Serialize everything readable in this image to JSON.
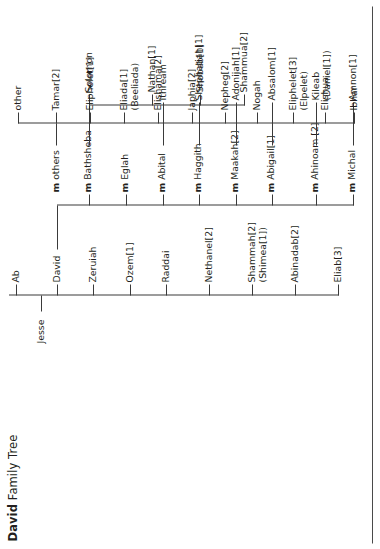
{
  "title": {
    "bold": "David",
    "rest": " Family Tree"
  },
  "root": {
    "label": "Jesse"
  },
  "generations": {
    "jesse_children_label": "Children of Jesse",
    "jesse_children": [
      {
        "name": "Eliab[3]"
      },
      {
        "name": "Abinadab[2]"
      },
      {
        "name": "Shammah[2]",
        "alt": "(Shimea[1])"
      },
      {
        "name": "Nethanel[2]"
      },
      {
        "name": "Raddai"
      },
      {
        "name": "Ozem[1]"
      },
      {
        "name": "Zeruiah"
      },
      {
        "name": "David"
      },
      {
        "name": "Ab"
      }
    ],
    "wives_label": "Wives of David",
    "wives": [
      {
        "name": "m Michal",
        "m": "m",
        "rest": "Michal"
      },
      {
        "name": "m Ahinoam [2]",
        "m": "m",
        "rest": "Ahinoam [2]"
      },
      {
        "name": "m Abigail[1]",
        "m": "m",
        "rest": "Abigail[1]"
      },
      {
        "name": "m Maakah[2]",
        "m": "m",
        "rest": "Maakah[2]"
      },
      {
        "name": "m Haggith",
        "m": "m",
        "rest": "Haggith"
      },
      {
        "name": "m Abital",
        "m": "m",
        "rest": "Abital"
      },
      {
        "name": "m Eglah",
        "m": "m",
        "rest": "Eglah"
      },
      {
        "name": "m Bathsheba",
        "m": "m",
        "rest": "Bathsheba"
      },
      {
        "name": "m others",
        "m": "m",
        "rest": "others"
      }
    ],
    "children_label": "Children of David",
    "hebron_children": [
      {
        "name": "Amnon[1]"
      },
      {
        "name": "Kileab",
        "alt": "(Daniel[1])"
      },
      {
        "name": "Absalom[1]"
      },
      {
        "name": "Adonijah[1]"
      },
      {
        "name": "Shephatiah[1]"
      },
      {
        "name": "Ithream"
      }
    ],
    "bathsheba_children": [
      {
        "name": "Shammua[2]"
      },
      {
        "name": "Shobab[1]"
      },
      {
        "name": "Nathan[1]"
      },
      {
        "name": "Solomon"
      }
    ],
    "other_children": [
      {
        "name": "Ibhar"
      },
      {
        "name": "Elishua"
      },
      {
        "name": "Eliphelet[3]",
        "alt": "(Elpelet)"
      },
      {
        "name": "Nogah"
      },
      {
        "name": "Nepheg[2]"
      },
      {
        "name": "Japhia[2]"
      },
      {
        "name": "Elishama[2]"
      },
      {
        "name": "Eliada[1]",
        "alt": "(Beeliada)"
      },
      {
        "name": "Eliphelet[1]"
      },
      {
        "name": "Tamar[2]"
      },
      {
        "name": "other"
      }
    ]
  },
  "colors": {
    "line": "#3a3a3a",
    "text": "#231f20",
    "rule": "#4a4a4a",
    "background": "#ffffff"
  }
}
